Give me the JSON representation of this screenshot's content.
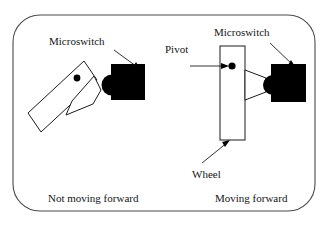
{
  "figure": {
    "background_color": "#ffffff",
    "frame_color": "#4a4a4a",
    "ink_color": "#1c1c1c",
    "switch_color": "#000000",
    "width": 329,
    "height": 226
  },
  "left_panel": {
    "caption": "Not moving forward",
    "labels": {
      "microswitch": "Microswitch"
    },
    "state": "released"
  },
  "right_panel": {
    "caption": "Moving forward",
    "labels": {
      "microswitch": "Microswitch",
      "pivot": "Pivot",
      "wheel": "Wheel"
    },
    "state": "pressed"
  }
}
